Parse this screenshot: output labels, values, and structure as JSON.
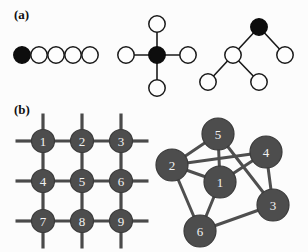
{
  "figure": {
    "width": 308,
    "height": 252,
    "background": "#fcfcfc"
  },
  "panels": [
    {
      "id": "a",
      "label": "(a)",
      "label_x": 14,
      "label_y": 8
    },
    {
      "id": "b",
      "label": "(b)",
      "label_x": 14,
      "label_y": 103
    }
  ],
  "colors": {
    "filled_node": "#0d0d0d",
    "open_node": "#fdfdfd",
    "open_node_stroke": "#1a1a1a",
    "gray_node": "#4d4d4d",
    "gray_node_stroke": "#3a3a3a",
    "node_label_text": "#f2f2f2",
    "edge_thin": "#1a1a1a",
    "edge_thick": "#4a4a4a",
    "edge_graph": "#4f4f4f",
    "panel_label_text": "#101010"
  },
  "chart_data": {
    "type": "diagram",
    "title": "",
    "subtitle": "",
    "graphs": [
      {
        "name": "chain-graph",
        "panel": "a",
        "node_radius": 8.2,
        "nodes": [
          {
            "id": "c1",
            "label": "",
            "x": 22,
            "y": 55,
            "fill": "filled"
          },
          {
            "id": "c2",
            "label": "",
            "x": 39,
            "y": 55,
            "fill": "open"
          },
          {
            "id": "c3",
            "label": "",
            "x": 56,
            "y": 55,
            "fill": "open"
          },
          {
            "id": "c4",
            "label": "",
            "x": 73,
            "y": 55,
            "fill": "open"
          },
          {
            "id": "c5",
            "label": "",
            "x": 90,
            "y": 55,
            "fill": "open"
          }
        ],
        "edges": [
          {
            "from": "c1",
            "to": "c2"
          },
          {
            "from": "c2",
            "to": "c3"
          },
          {
            "from": "c3",
            "to": "c4"
          },
          {
            "from": "c4",
            "to": "c5"
          }
        ]
      },
      {
        "name": "star-graph",
        "panel": "a",
        "node_radius": 8.2,
        "nodes": [
          {
            "id": "s0",
            "label": "",
            "x": 157,
            "y": 55,
            "fill": "filled"
          },
          {
            "id": "s1",
            "label": "",
            "x": 157,
            "y": 24,
            "fill": "open"
          },
          {
            "id": "s2",
            "label": "",
            "x": 188,
            "y": 55,
            "fill": "open"
          },
          {
            "id": "s3",
            "label": "",
            "x": 157,
            "y": 88,
            "fill": "open"
          },
          {
            "id": "s4",
            "label": "",
            "x": 126,
            "y": 55,
            "fill": "open"
          }
        ],
        "edges": [
          {
            "from": "s0",
            "to": "s1"
          },
          {
            "from": "s0",
            "to": "s2"
          },
          {
            "from": "s0",
            "to": "s3"
          },
          {
            "from": "s0",
            "to": "s4"
          }
        ]
      },
      {
        "name": "tree-graph",
        "panel": "a",
        "node_radius": 8.2,
        "nodes": [
          {
            "id": "t0",
            "label": "",
            "x": 259,
            "y": 27,
            "fill": "filled"
          },
          {
            "id": "t1",
            "label": "",
            "x": 233,
            "y": 55,
            "fill": "open"
          },
          {
            "id": "t2",
            "label": "",
            "x": 285,
            "y": 55,
            "fill": "open"
          },
          {
            "id": "t3",
            "label": "",
            "x": 208,
            "y": 82,
            "fill": "open"
          },
          {
            "id": "t4",
            "label": "",
            "x": 259,
            "y": 82,
            "fill": "open"
          }
        ],
        "edges": [
          {
            "from": "t0",
            "to": "t1"
          },
          {
            "from": "t0",
            "to": "t2"
          },
          {
            "from": "t1",
            "to": "t3"
          },
          {
            "from": "t1",
            "to": "t4"
          }
        ]
      },
      {
        "name": "lattice-graph",
        "panel": "b",
        "node_radius": 11.5,
        "stub_length": 16,
        "nodes": [
          {
            "id": "g1",
            "label": "1",
            "x": 43,
            "y": 141,
            "fill": "gray"
          },
          {
            "id": "g2",
            "label": "2",
            "x": 82,
            "y": 141,
            "fill": "gray"
          },
          {
            "id": "g3",
            "label": "3",
            "x": 121,
            "y": 141,
            "fill": "gray"
          },
          {
            "id": "g4",
            "label": "4",
            "x": 43,
            "y": 181,
            "fill": "gray"
          },
          {
            "id": "g5",
            "label": "5",
            "x": 82,
            "y": 181,
            "fill": "gray"
          },
          {
            "id": "g6",
            "label": "6",
            "x": 121,
            "y": 181,
            "fill": "gray"
          },
          {
            "id": "g7",
            "label": "7",
            "x": 43,
            "y": 221,
            "fill": "gray"
          },
          {
            "id": "g8",
            "label": "8",
            "x": 82,
            "y": 221,
            "fill": "gray"
          },
          {
            "id": "g9",
            "label": "9",
            "x": 121,
            "y": 221,
            "fill": "gray"
          }
        ],
        "edges": [
          {
            "from": "g1",
            "to": "g2"
          },
          {
            "from": "g2",
            "to": "g3"
          },
          {
            "from": "g4",
            "to": "g5"
          },
          {
            "from": "g5",
            "to": "g6"
          },
          {
            "from": "g7",
            "to": "g8"
          },
          {
            "from": "g8",
            "to": "g9"
          },
          {
            "from": "g1",
            "to": "g4"
          },
          {
            "from": "g4",
            "to": "g7"
          },
          {
            "from": "g2",
            "to": "g5"
          },
          {
            "from": "g5",
            "to": "g8"
          },
          {
            "from": "g3",
            "to": "g6"
          },
          {
            "from": "g6",
            "to": "g9"
          }
        ],
        "stubs": [
          {
            "node": "g1",
            "dir": "up"
          },
          {
            "node": "g2",
            "dir": "up"
          },
          {
            "node": "g3",
            "dir": "up"
          },
          {
            "node": "g7",
            "dir": "down"
          },
          {
            "node": "g8",
            "dir": "down"
          },
          {
            "node": "g9",
            "dir": "down"
          },
          {
            "node": "g1",
            "dir": "left"
          },
          {
            "node": "g4",
            "dir": "left"
          },
          {
            "node": "g7",
            "dir": "left"
          },
          {
            "node": "g3",
            "dir": "right"
          },
          {
            "node": "g6",
            "dir": "right"
          },
          {
            "node": "g9",
            "dir": "right"
          }
        ]
      },
      {
        "name": "general-graph",
        "panel": "b",
        "node_radius": 16,
        "nodes": [
          {
            "id": "n1",
            "label": "1",
            "x": 220,
            "y": 182,
            "fill": "gray"
          },
          {
            "id": "n2",
            "label": "2",
            "x": 172,
            "y": 165,
            "fill": "gray"
          },
          {
            "id": "n3",
            "label": "3",
            "x": 273,
            "y": 205,
            "fill": "gray"
          },
          {
            "id": "n4",
            "label": "4",
            "x": 266,
            "y": 152,
            "fill": "gray"
          },
          {
            "id": "n5",
            "label": "5",
            "x": 218,
            "y": 134,
            "fill": "gray"
          },
          {
            "id": "n6",
            "label": "6",
            "x": 200,
            "y": 231,
            "fill": "gray"
          }
        ],
        "edges": [
          {
            "from": "n5",
            "to": "n2"
          },
          {
            "from": "n5",
            "to": "n1"
          },
          {
            "from": "n5",
            "to": "n3"
          },
          {
            "from": "n2",
            "to": "n1"
          },
          {
            "from": "n2",
            "to": "n4"
          },
          {
            "from": "n2",
            "to": "n6"
          },
          {
            "from": "n1",
            "to": "n4"
          },
          {
            "from": "n1",
            "to": "n6"
          },
          {
            "from": "n4",
            "to": "n3"
          },
          {
            "from": "n3",
            "to": "n6"
          }
        ]
      }
    ]
  }
}
